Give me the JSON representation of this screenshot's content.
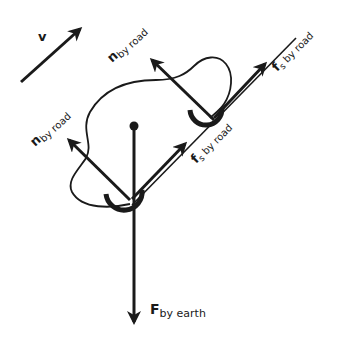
{
  "diagram": {
    "type": "free-body diagram",
    "colors": {
      "stroke": "#1a1a1a",
      "background": "#ffffff"
    },
    "velocity": {
      "symbol": "v",
      "subscript": ""
    },
    "forces": [
      {
        "id": "normal-rear",
        "symbol": "n",
        "subscript": "by road"
      },
      {
        "id": "normal-front",
        "symbol": "n",
        "subscript": "by road"
      },
      {
        "id": "friction-front",
        "symbol": "f",
        "sub_s": "s",
        "subscript": " by road"
      },
      {
        "id": "friction-rear",
        "symbol": "f",
        "sub_s": "s",
        "subscript": " by road"
      },
      {
        "id": "gravity",
        "symbol": "F",
        "subscript": "by earth"
      }
    ]
  }
}
